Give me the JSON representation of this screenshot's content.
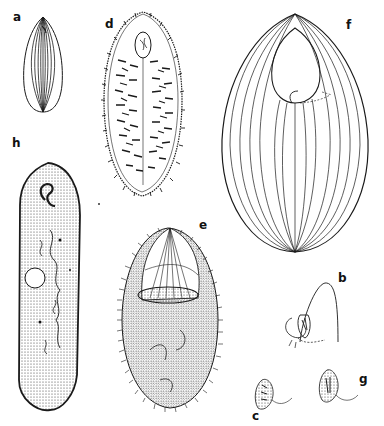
{
  "plate": {
    "figures": [
      {
        "id": "a",
        "label": "a",
        "description": "small ovoid ciliate with longitudinal kineties"
      },
      {
        "id": "b",
        "label": "b",
        "description": "cell with dome-shaped membrane and oral apparatus"
      },
      {
        "id": "c",
        "label": "c",
        "description": "small ovoid cell with cilia trailing"
      },
      {
        "id": "d",
        "label": "d",
        "description": "ovoid ciliate covered with short cilia rows"
      },
      {
        "id": "e",
        "label": "e",
        "description": "ovoid ciliate with large oral cavity, stippled cytoplasm and fringe of cilia"
      },
      {
        "id": "f",
        "label": "f",
        "description": "large ovoid ciliate with longitudinal kineties and anterior oral opening"
      },
      {
        "id": "g",
        "label": "g",
        "description": "small ovoid cell with cilia trailing"
      },
      {
        "id": "h",
        "label": "h",
        "description": "elongate slipper-shaped ciliate with stippled surface, oral groove and vacuole"
      }
    ],
    "colors": {
      "ink": "#1a1a1a",
      "paper": "#ffffff"
    }
  }
}
